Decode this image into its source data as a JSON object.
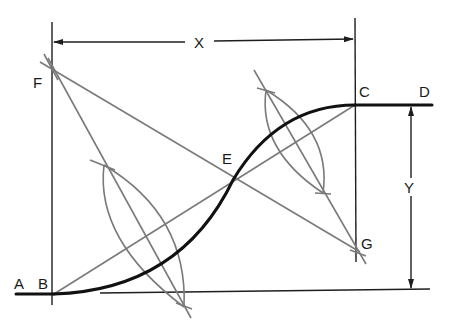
{
  "diagram": {
    "labels": {
      "A": "A",
      "B": "B",
      "C": "C",
      "D": "D",
      "E": "E",
      "F": "F",
      "G": "G",
      "X": "X",
      "Y": "Y"
    },
    "dimensions": [
      {
        "name": "horizontal-offset",
        "label": "X",
        "between": [
          "B",
          "C"
        ]
      },
      {
        "name": "vertical-offset",
        "label": "Y",
        "between": [
          "C",
          "baseline"
        ]
      }
    ],
    "colors": {
      "curve": "#111111",
      "construction": "#7a7a7a",
      "lines": "#1e1e1e"
    }
  }
}
